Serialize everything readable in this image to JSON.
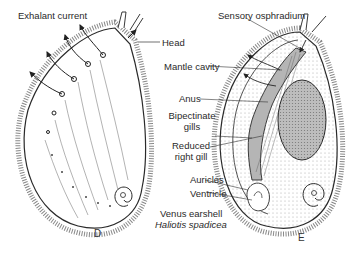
{
  "diagram": {
    "figure_left": {
      "letter": "D",
      "labels": {
        "exhalant_current": "Exhalant current",
        "head": "Head"
      }
    },
    "figure_right": {
      "letter": "E",
      "labels": {
        "sensory_osphradium": "Sensory osphradium",
        "mantle_cavity": "Mantle cavity",
        "anus": "Anus",
        "bipectinate_gills_1": "Bipectinate",
        "bipectinate_gills_2": "gills",
        "reduced_right_gill_1": "Reduced",
        "reduced_right_gill_2": "right gill",
        "auricles": "Auricles",
        "ventricle": "Ventricle"
      }
    },
    "caption": {
      "common_name": "Venus earshell",
      "scientific_name": "Haliotis spadicea"
    },
    "colors": {
      "line": "#2a2a2a",
      "shading": "#8a8a8a",
      "background": "#ffffff"
    }
  }
}
